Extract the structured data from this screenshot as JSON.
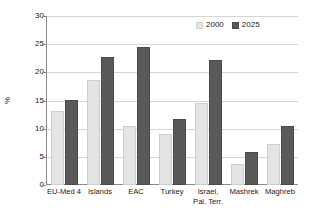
{
  "chart_data": {
    "type": "bar",
    "title": "",
    "subtitle": "",
    "xlabel": "",
    "ylabel": "%",
    "ylim": [
      0,
      30
    ],
    "yticks": [
      0,
      5,
      10,
      15,
      20,
      25,
      30
    ],
    "ytick_labels": [
      "0",
      "5",
      "10",
      "15",
      "20",
      "25",
      "30"
    ],
    "grid": true,
    "legend_position": "top-right",
    "categories": [
      "EU-Med 4",
      "Islands",
      "EAC",
      "Turkey",
      "Israel,\nPal. Terr.",
      "Mashrek",
      "Maghreb"
    ],
    "series": [
      {
        "name": "2000",
        "color": "#e4e4e4",
        "values": [
          13.1,
          18.6,
          10.5,
          9.0,
          14.5,
          3.7,
          7.3
        ]
      },
      {
        "name": "2025",
        "color": "#595959",
        "values": [
          15.1,
          22.8,
          24.5,
          11.7,
          22.2,
          5.9,
          10.5
        ]
      }
    ]
  },
  "legend": {
    "items": [
      {
        "label": "2000",
        "swatch": "light-gray-square"
      },
      {
        "label": "2025",
        "swatch": "dark-gray-square"
      }
    ]
  },
  "axes": {
    "y_title": "%"
  }
}
